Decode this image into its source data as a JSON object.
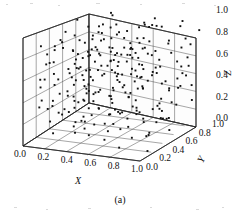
{
  "figure": {
    "caption": "(a)",
    "background_color": "#ffffff",
    "point_color": "#111111",
    "grid_color": "#3a3a3a"
  },
  "chart_data": {
    "type": "scatter",
    "projection": "3d",
    "title": "",
    "xlabel": "X",
    "ylabel": "Y",
    "zlabel": "Z",
    "xlim": [
      0.0,
      1.0
    ],
    "ylim": [
      0.0,
      1.0
    ],
    "zlim": [
      0.0,
      1.0
    ],
    "grid": true,
    "legend": "none",
    "xticks": [
      "0.0",
      "0.2",
      "0.4",
      "0.6",
      "0.8",
      "1.0"
    ],
    "yticks": [
      "0.0",
      "0.2",
      "0.4",
      "0.6",
      "0.8",
      "1.0"
    ],
    "zticks": [
      "0.0",
      "0.2",
      "0.4",
      "0.6",
      "0.8",
      "1.0"
    ],
    "xtick_values": [
      0.0,
      0.2,
      0.4,
      0.6,
      0.8,
      1.0
    ],
    "ytick_values": [
      0.0,
      0.2,
      0.4,
      0.6,
      0.8,
      1.0
    ],
    "ztick_values": [
      0.0,
      0.2,
      0.4,
      0.6,
      0.8,
      1.0
    ],
    "n_points": 260,
    "points": [
      [
        0.12,
        0.07,
        0.41
      ],
      [
        0.63,
        0.88,
        0.92
      ],
      [
        0.31,
        0.44,
        0.7
      ],
      [
        0.85,
        0.21,
        0.33
      ],
      [
        0.48,
        0.65,
        0.12
      ],
      [
        0.07,
        0.52,
        0.86
      ],
      [
        0.74,
        0.38,
        0.55
      ],
      [
        0.26,
        0.91,
        0.19
      ],
      [
        0.59,
        0.14,
        0.77
      ],
      [
        0.93,
        0.69,
        0.48
      ],
      [
        0.41,
        0.27,
        0.05
      ],
      [
        0.18,
        0.78,
        0.63
      ],
      [
        0.67,
        0.05,
        0.28
      ],
      [
        0.35,
        0.59,
        0.94
      ],
      [
        0.88,
        0.46,
        0.16
      ],
      [
        0.02,
        0.33,
        0.72
      ],
      [
        0.55,
        0.82,
        0.39
      ],
      [
        0.79,
        0.11,
        0.61
      ],
      [
        0.23,
        0.66,
        0.25
      ],
      [
        0.97,
        0.95,
        0.83
      ],
      [
        0.44,
        0.18,
        0.52
      ],
      [
        0.15,
        0.73,
        0.08
      ],
      [
        0.7,
        0.49,
        0.9
      ],
      [
        0.38,
        0.02,
        0.36
      ],
      [
        0.82,
        0.61,
        0.67
      ],
      [
        0.09,
        0.25,
        0.14
      ],
      [
        0.61,
        0.87,
        0.58
      ],
      [
        0.29,
        0.4,
        0.31
      ],
      [
        0.91,
        0.09,
        0.79
      ],
      [
        0.52,
        0.54,
        0.45
      ],
      [
        0.05,
        0.97,
        0.23
      ],
      [
        0.76,
        0.31,
        0.88
      ],
      [
        0.34,
        0.7,
        0.06
      ],
      [
        0.66,
        0.16,
        0.49
      ],
      [
        0.2,
        0.84,
        0.74
      ],
      [
        0.95,
        0.42,
        0.29
      ],
      [
        0.47,
        0.58,
        0.96
      ],
      [
        0.13,
        0.03,
        0.62
      ],
      [
        0.72,
        0.76,
        0.17
      ],
      [
        0.39,
        0.35,
        0.81
      ],
      [
        0.86,
        0.89,
        0.44
      ],
      [
        0.01,
        0.61,
        0.1
      ],
      [
        0.57,
        0.22,
        0.66
      ],
      [
        0.28,
        0.5,
        0.35
      ],
      [
        0.8,
        0.07,
        0.93
      ],
      [
        0.46,
        0.93,
        0.51
      ],
      [
        0.17,
        0.29,
        0.2
      ],
      [
        0.68,
        0.64,
        0.75
      ],
      [
        0.36,
        0.8,
        0.4
      ],
      [
        0.99,
        0.13,
        0.04
      ],
      [
        0.5,
        0.46,
        0.59
      ],
      [
        0.24,
        0.18,
        0.87
      ],
      [
        0.73,
        0.92,
        0.27
      ],
      [
        0.11,
        0.56,
        0.68
      ],
      [
        0.64,
        0.34,
        0.11
      ],
      [
        0.42,
        0.71,
        0.83
      ],
      [
        0.89,
        0.24,
        0.56
      ],
      [
        0.06,
        0.85,
        0.37
      ],
      [
        0.78,
        0.53,
        0.02
      ],
      [
        0.32,
        0.12,
        0.71
      ],
      [
        0.54,
        0.67,
        0.3
      ],
      [
        0.96,
        0.79,
        0.64
      ],
      [
        0.21,
        0.41,
        0.89
      ],
      [
        0.69,
        0.01,
        0.15
      ],
      [
        0.45,
        0.96,
        0.78
      ],
      [
        0.03,
        0.48,
        0.43
      ],
      [
        0.83,
        0.63,
        0.97
      ],
      [
        0.37,
        0.26,
        0.22
      ],
      [
        0.6,
        0.74,
        0.54
      ],
      [
        0.16,
        0.09,
        0.33
      ],
      [
        0.92,
        0.57,
        0.85
      ],
      [
        0.49,
        0.3,
        0.47
      ],
      [
        0.27,
        0.86,
        0.13
      ],
      [
        0.75,
        0.43,
        0.69
      ],
      [
        0.08,
        0.68,
        0.91
      ],
      [
        0.58,
        0.05,
        0.26
      ],
      [
        0.4,
        0.62,
        0.6
      ],
      [
        0.87,
        0.36,
        0.08
      ],
      [
        0.19,
        0.99,
        0.73
      ],
      [
        0.65,
        0.2,
        0.41
      ],
      [
        0.33,
        0.77,
        0.95
      ],
      [
        0.94,
        0.51,
        0.18
      ],
      [
        0.1,
        0.15,
        0.57
      ],
      [
        0.71,
        0.9,
        0.34
      ],
      [
        0.43,
        0.39,
        0.76
      ],
      [
        0.84,
        0.72,
        0.09
      ],
      [
        0.04,
        0.28,
        0.65
      ],
      [
        0.56,
        0.83,
        0.46
      ],
      [
        0.3,
        0.06,
        0.98
      ],
      [
        0.77,
        0.6,
        0.21
      ],
      [
        0.51,
        0.45,
        0.8
      ],
      [
        0.22,
        0.94,
        0.53
      ],
      [
        0.9,
        0.17,
        0.37
      ],
      [
        0.14,
        0.81,
        0.72
      ],
      [
        0.62,
        0.37,
        0.24
      ],
      [
        0.98,
        0.66,
        0.61
      ],
      [
        0.25,
        0.23,
        0.45
      ],
      [
        0.81,
        0.98,
        0.88
      ],
      [
        0.53,
        0.1,
        0.32
      ],
      [
        0.35,
        0.55,
        0.67
      ],
      [
        0.15,
        0.44,
        0.52
      ],
      [
        0.66,
        0.72,
        0.41
      ],
      [
        0.47,
        0.19,
        0.63
      ],
      [
        0.29,
        0.63,
        0.29
      ],
      [
        0.88,
        0.84,
        0.7
      ],
      [
        0.09,
        0.38,
        0.17
      ],
      [
        0.74,
        0.27,
        0.84
      ],
      [
        0.41,
        0.91,
        0.36
      ],
      [
        0.6,
        0.53,
        0.05
      ],
      [
        0.2,
        0.11,
        0.76
      ],
      [
        0.93,
        0.7,
        0.39
      ],
      [
        0.38,
        0.47,
        0.92
      ],
      [
        0.07,
        0.86,
        0.54
      ],
      [
        0.68,
        0.08,
        0.2
      ],
      [
        0.5,
        0.75,
        0.68
      ],
      [
        0.85,
        0.32,
        0.99
      ],
      [
        0.31,
        0.6,
        0.15
      ],
      [
        0.59,
        0.96,
        0.58
      ],
      [
        0.12,
        0.24,
        0.34
      ],
      [
        0.79,
        0.49,
        0.77
      ],
      [
        0.45,
        0.13,
        0.43
      ],
      [
        0.26,
        0.69,
        0.87
      ],
      [
        0.97,
        0.4,
        0.23
      ],
      [
        0.17,
        0.88,
        0.65
      ],
      [
        0.7,
        0.58,
        0.12
      ],
      [
        0.36,
        0.04,
        0.5
      ],
      [
        0.91,
        0.77,
        0.93
      ],
      [
        0.02,
        0.52,
        0.28
      ],
      [
        0.64,
        0.3,
        0.71
      ],
      [
        0.48,
        0.65,
        0.47
      ],
      [
        0.23,
        0.16,
        0.95
      ],
      [
        0.82,
        0.93,
        0.3
      ],
      [
        0.55,
        0.42,
        0.59
      ],
      [
        0.34,
        0.79,
        0.07
      ],
      [
        0.99,
        0.21,
        0.74
      ],
      [
        0.13,
        0.57,
        0.4
      ],
      [
        0.72,
        0.35,
        0.86
      ],
      [
        0.44,
        0.82,
        0.19
      ],
      [
        0.05,
        0.67,
        0.62
      ],
      [
        0.67,
        0.12,
        0.51
      ],
      [
        0.28,
        0.95,
        0.44
      ],
      [
        0.89,
        0.29,
        0.1
      ],
      [
        0.52,
        0.61,
        0.83
      ],
      [
        0.18,
        0.46,
        0.26
      ],
      [
        0.76,
        0.73,
        0.55
      ],
      [
        0.4,
        0.03,
        0.68
      ],
      [
        0.95,
        0.87,
        0.35
      ],
      [
        0.08,
        0.34,
        0.8
      ],
      [
        0.61,
        0.5,
        0.14
      ],
      [
        0.37,
        0.74,
        0.6
      ],
      [
        0.86,
        0.18,
        0.91
      ],
      [
        0.21,
        0.64,
        0.48
      ],
      [
        0.57,
        0.31,
        0.25
      ],
      [
        0.3,
        0.89,
        0.72
      ],
      [
        0.94,
        0.55,
        0.06
      ],
      [
        0.11,
        0.07,
        0.53
      ],
      [
        0.69,
        0.8,
        0.89
      ],
      [
        0.46,
        0.25,
        0.38
      ],
      [
        0.24,
        0.59,
        0.64
      ],
      [
        0.8,
        0.41,
        0.17
      ],
      [
        0.53,
        0.97,
        0.79
      ],
      [
        0.06,
        0.14,
        0.31
      ],
      [
        0.75,
        0.68,
        0.56
      ],
      [
        0.39,
        0.36,
        0.9
      ],
      [
        0.92,
        0.09,
        0.42
      ],
      [
        0.19,
        0.76,
        0.22
      ],
      [
        0.63,
        0.54,
        0.69
      ],
      [
        0.32,
        0.22,
        0.08
      ],
      [
        0.87,
        0.92,
        0.75
      ],
      [
        0.01,
        0.45,
        0.49
      ],
      [
        0.58,
        0.71,
        0.33
      ],
      [
        0.42,
        0.16,
        0.81
      ],
      [
        0.96,
        0.62,
        0.27
      ],
      [
        0.16,
        0.84,
        0.58
      ],
      [
        0.71,
        0.39,
        0.02
      ],
      [
        0.49,
        0.05,
        0.66
      ],
      [
        0.27,
        0.51,
        0.94
      ],
      [
        0.83,
        0.78,
        0.21
      ],
      [
        0.1,
        0.3,
        0.46
      ],
      [
        0.65,
        0.66,
        0.73
      ],
      [
        0.35,
        0.98,
        0.11
      ],
      [
        0.9,
        0.43,
        0.63
      ],
      [
        0.04,
        0.2,
        0.85
      ],
      [
        0.54,
        0.85,
        0.29
      ],
      [
        0.22,
        0.48,
        0.57
      ],
      [
        0.78,
        0.15,
        0.96
      ],
      [
        0.47,
        0.7,
        0.35
      ],
      [
        0.03,
        0.91,
        0.13
      ],
      [
        0.66,
        0.26,
        0.6
      ],
      [
        0.33,
        0.64,
        0.78
      ],
      [
        0.98,
        0.33,
        0.4
      ],
      [
        0.14,
        0.59,
        0.19
      ],
      [
        0.73,
        0.47,
        0.87
      ],
      [
        0.43,
        0.81,
        0.52
      ],
      [
        0.62,
        0.1,
        0.7
      ],
      [
        0.85,
        0.56,
        0.24
      ],
      [
        0.25,
        0.37,
        0.61
      ],
      [
        0.51,
        0.94,
        0.82
      ],
      [
        0.07,
        0.72,
        0.44
      ],
      [
        0.81,
        0.02,
        0.09
      ],
      [
        0.56,
        0.63,
        0.67
      ],
      [
        0.29,
        0.28,
        0.15
      ],
      [
        0.93,
        0.86,
        0.53
      ],
      [
        0.38,
        0.11,
        0.77
      ],
      [
        0.17,
        0.69,
        0.32
      ],
      [
        0.68,
        0.42,
        0.88
      ],
      [
        0.45,
        0.57,
        0.04
      ],
      [
        0.97,
        0.75,
        0.49
      ],
      [
        0.12,
        0.19,
        0.71
      ],
      [
        0.74,
        0.9,
        0.26
      ],
      [
        0.31,
        0.35,
        0.56
      ],
      [
        0.59,
        0.79,
        0.91
      ],
      [
        0.84,
        0.23,
        0.38
      ],
      [
        0.2,
        0.53,
        0.05
      ],
      [
        0.88,
        0.65,
        0.84
      ],
      [
        0.48,
        0.08,
        0.59
      ],
      [
        0.26,
        0.96,
        0.3
      ],
      [
        0.7,
        0.31,
        0.47
      ],
      [
        0.4,
        0.6,
        0.73
      ],
      [
        0.02,
        0.41,
        0.21
      ],
      [
        0.77,
        0.88,
        0.62
      ],
      [
        0.55,
        0.17,
        0.36
      ],
      [
        0.34,
        0.73,
        0.99
      ],
      [
        0.91,
        0.49,
        0.51
      ],
      [
        0.09,
        0.62,
        0.12
      ],
      [
        0.64,
        0.24,
        0.79
      ],
      [
        0.44,
        0.87,
        0.43
      ],
      [
        0.99,
        0.06,
        0.65
      ],
      [
        0.15,
        0.5,
        0.28
      ],
      [
        0.72,
        0.68,
        0.95
      ],
      [
        0.36,
        0.13,
        0.18
      ],
      [
        0.86,
        0.81,
        0.58
      ],
      [
        0.05,
        0.39,
        0.74
      ],
      [
        0.61,
        0.58,
        0.22
      ],
      [
        0.23,
        0.93,
        0.66
      ],
      [
        0.79,
        0.04,
        0.41
      ],
      [
        0.5,
        0.69,
        0.86
      ],
      [
        0.28,
        0.44,
        0.09
      ],
      [
        0.95,
        0.27,
        0.68
      ],
      [
        0.18,
        0.77,
        0.5
      ],
      [
        0.67,
        0.52,
        0.31
      ],
      [
        0.41,
        0.21,
        0.93
      ],
      [
        0.89,
        0.98,
        0.16
      ],
      [
        0.08,
        0.66,
        0.55
      ],
      [
        0.6,
        0.36,
        0.8
      ],
      [
        0.3,
        0.83,
        0.25
      ],
      [
        0.94,
        0.11,
        0.72
      ],
      [
        0.13,
        0.54,
        0.37
      ],
      [
        0.76,
        0.74,
        0.07
      ],
      [
        0.46,
        0.32,
        0.64
      ],
      [
        0.22,
        0.89,
        0.42
      ],
      [
        0.82,
        0.46,
        0.9
      ],
      [
        0.52,
        0.01,
        0.23
      ],
      [
        0.37,
        0.67,
        0.57
      ],
      [
        0.98,
        0.8,
        0.76
      ],
      [
        0.11,
        0.26,
        0.03
      ],
      [
        0.63,
        0.61,
        0.49
      ],
      [
        0.39,
        0.14,
        0.85
      ],
      [
        0.87,
        0.55,
        0.34
      ],
      [
        0.06,
        0.75,
        0.69
      ]
    ]
  }
}
